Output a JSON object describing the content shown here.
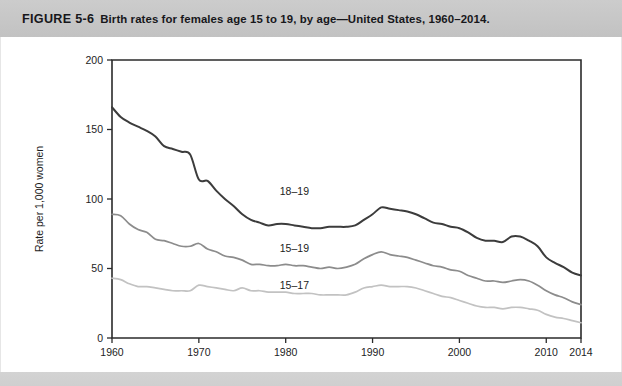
{
  "caption": {
    "label": "FIGURE 5-6",
    "title": "Birth rates for females age 15 to 19, by age—United States, 1960–2014."
  },
  "chart_data": {
    "type": "line",
    "title": "Birth rates for females age 15 to 19, by age—United States, 1960–2014",
    "xlabel": "",
    "ylabel": "Rate per 1,000 women",
    "xlim": [
      1960,
      2014
    ],
    "ylim": [
      0,
      200
    ],
    "yticks": [
      0,
      50,
      100,
      150,
      200
    ],
    "xticks": [
      1960,
      1970,
      1980,
      1990,
      2000,
      2010,
      2014
    ],
    "grid": false,
    "legend": "inline-labels",
    "x": [
      1960,
      1961,
      1962,
      1963,
      1964,
      1965,
      1966,
      1967,
      1968,
      1969,
      1970,
      1971,
      1972,
      1973,
      1974,
      1975,
      1976,
      1977,
      1978,
      1979,
      1980,
      1981,
      1982,
      1983,
      1984,
      1985,
      1986,
      1987,
      1988,
      1989,
      1990,
      1991,
      1992,
      1993,
      1994,
      1995,
      1996,
      1997,
      1998,
      1999,
      2000,
      2001,
      2002,
      2003,
      2004,
      2005,
      2006,
      2007,
      2008,
      2009,
      2010,
      2011,
      2012,
      2013,
      2014
    ],
    "series": [
      {
        "name": "18–19",
        "color": "#3c3c3c",
        "label_x": 1981,
        "label_y": 103,
        "values": [
          166.0,
          159.0,
          155.0,
          152.0,
          149.0,
          145.0,
          138.0,
          136.0,
          134.0,
          132.0,
          114.0,
          113.0,
          106.0,
          100.0,
          95.0,
          89.0,
          85.0,
          83.0,
          81.0,
          82.0,
          82.0,
          81.0,
          80.0,
          79.0,
          79.0,
          80.0,
          80.0,
          80.0,
          81.0,
          85.0,
          89.0,
          94.0,
          93.0,
          92.0,
          91.0,
          89.0,
          86.0,
          83.0,
          82.0,
          80.0,
          79.0,
          76.0,
          72.0,
          70.0,
          70.0,
          69.0,
          73.0,
          73.0,
          70.0,
          66.0,
          58.0,
          54.0,
          51.0,
          47.0,
          45.0
        ]
      },
      {
        "name": "15–19",
        "color": "#8c8c8c",
        "label_x": 1981,
        "label_y": 62,
        "values": [
          89.0,
          88.0,
          82.0,
          78.0,
          76.0,
          71.0,
          70.0,
          68.0,
          66.0,
          66.0,
          68.0,
          64.0,
          62.0,
          59.0,
          58.0,
          56.0,
          53.0,
          53.0,
          52.0,
          52.0,
          53.0,
          52.0,
          52.0,
          51.0,
          50.0,
          51.0,
          50.0,
          51.0,
          53.0,
          57.0,
          60.0,
          62.0,
          60.0,
          59.0,
          58.0,
          56.0,
          54.0,
          52.0,
          51.0,
          49.0,
          48.0,
          45.0,
          43.0,
          41.0,
          41.0,
          40.0,
          41.0,
          42.0,
          41.0,
          38.0,
          34.0,
          31.0,
          29.0,
          26.0,
          24.0
        ]
      },
      {
        "name": "15–17",
        "color": "#c2c2c2",
        "label_x": 1981,
        "label_y": 35,
        "values": [
          43.0,
          42.0,
          39.0,
          37.0,
          37.0,
          36.0,
          35.0,
          34.0,
          34.0,
          34.0,
          38.0,
          37.0,
          36.0,
          35.0,
          34.0,
          36.0,
          34.0,
          34.0,
          33.0,
          33.0,
          33.0,
          32.0,
          32.0,
          32.0,
          31.0,
          31.0,
          31.0,
          31.0,
          33.0,
          36.0,
          37.0,
          38.0,
          37.0,
          37.0,
          37.0,
          36.0,
          34.0,
          32.0,
          30.0,
          29.0,
          27.0,
          25.0,
          23.0,
          22.0,
          22.0,
          21.0,
          22.0,
          22.0,
          21.0,
          20.0,
          17.0,
          15.0,
          14.0,
          12.5,
          11.0
        ]
      }
    ]
  }
}
